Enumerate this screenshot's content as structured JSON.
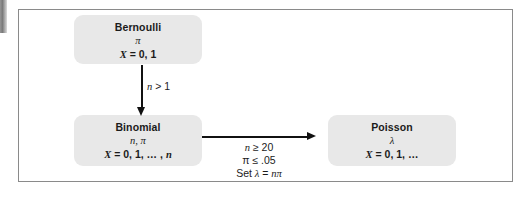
{
  "figure": {
    "type": "flowchart"
  },
  "nodes": [
    {
      "id": "bernoulli",
      "title": "Bernoulli",
      "parameters": "π",
      "support_prefix": "X",
      "support_rest": " = 0, 1"
    },
    {
      "id": "binomial",
      "title": "Binomial",
      "param_italic": "n",
      "param_rest": ", π",
      "support_prefix": "X",
      "support_rest": " = 0, 1, … , ",
      "support_tail": "n"
    },
    {
      "id": "poisson",
      "title": "Poisson",
      "parameters": "λ",
      "support_prefix": "X",
      "support_rest": " = 0, 1, …"
    }
  ],
  "edges": {
    "bernoulli_to_binomial": {
      "label_italic": "n",
      "label_rest": " > 1"
    },
    "binomial_to_poisson": {
      "line1_italic": "n",
      "line1_rest": " ≥ 20",
      "line2": "π ≤ .05",
      "line3_prefix": "Set ",
      "line3_lambda": "λ",
      "line3_mid": " = ",
      "line3_tail": "nπ"
    }
  },
  "colors": {
    "node_fill": "#e8e8e8",
    "frame_border": "#8a8a8a",
    "arrow": "#111111",
    "text": "#1b1b1b",
    "background": "#ffffff"
  }
}
